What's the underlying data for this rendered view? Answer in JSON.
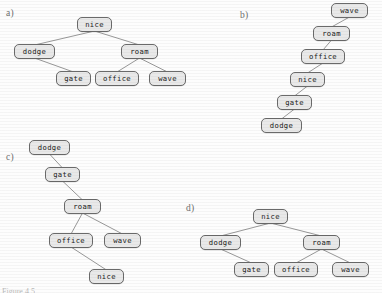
{
  "figure": {
    "caption": "Figure 4.5",
    "node_fill": "#e9e9e9",
    "node_border": "#6a6a6a",
    "edge_color": "#8c8c8c",
    "text_color": "#1a1a1a",
    "background": "#fdfdfd"
  },
  "panels": [
    {
      "id": "a",
      "label": "a)",
      "label_pos": {
        "x": 6,
        "y": 8
      },
      "root": "nice",
      "nodes": [
        {
          "key": "nice",
          "text": "nice",
          "x": 77,
          "y": 17,
          "w": 35
        },
        {
          "key": "dodge",
          "text": "dodge",
          "x": 14,
          "y": 44,
          "w": 41
        },
        {
          "key": "roam",
          "text": "roam",
          "x": 121,
          "y": 44,
          "w": 37
        },
        {
          "key": "gate",
          "text": "gate",
          "x": 56,
          "y": 71,
          "w": 35
        },
        {
          "key": "office",
          "text": "office",
          "x": 95,
          "y": 71,
          "w": 44
        },
        {
          "key": "wave",
          "text": "wave",
          "x": 149,
          "y": 71,
          "w": 37
        }
      ],
      "edges": [
        {
          "from": "nice",
          "to": "dodge",
          "side": "left"
        },
        {
          "from": "nice",
          "to": "roam",
          "side": "right"
        },
        {
          "from": "dodge",
          "to": "gate",
          "side": "right"
        },
        {
          "from": "roam",
          "to": "office",
          "side": "left"
        },
        {
          "from": "roam",
          "to": "wave",
          "side": "right"
        }
      ]
    },
    {
      "id": "b",
      "label": "b)",
      "label_pos": {
        "x": 240,
        "y": 10
      },
      "root": "wave",
      "nodes": [
        {
          "key": "wave",
          "text": "wave",
          "x": 331,
          "y": 3,
          "w": 37
        },
        {
          "key": "roam",
          "text": "roam",
          "x": 313,
          "y": 26,
          "w": 37
        },
        {
          "key": "office",
          "text": "office",
          "x": 301,
          "y": 49,
          "w": 44
        },
        {
          "key": "nice",
          "text": "nice",
          "x": 290,
          "y": 72,
          "w": 35
        },
        {
          "key": "gate",
          "text": "gate",
          "x": 277,
          "y": 95,
          "w": 35
        },
        {
          "key": "dodge",
          "text": "dodge",
          "x": 261,
          "y": 118,
          "w": 41
        }
      ],
      "edges": [
        {
          "from": "wave",
          "to": "roam",
          "side": "left"
        },
        {
          "from": "roam",
          "to": "office",
          "side": "left"
        },
        {
          "from": "office",
          "to": "nice",
          "side": "left"
        },
        {
          "from": "nice",
          "to": "gate",
          "side": "left"
        },
        {
          "from": "gate",
          "to": "dodge",
          "side": "left"
        }
      ]
    },
    {
      "id": "c",
      "label": "c)",
      "label_pos": {
        "x": 6,
        "y": 152
      },
      "root": "dodge",
      "nodes": [
        {
          "key": "dodge",
          "text": "dodge",
          "x": 29,
          "y": 140,
          "w": 41
        },
        {
          "key": "gate",
          "text": "gate",
          "x": 45,
          "y": 167,
          "w": 35
        },
        {
          "key": "roam",
          "text": "roam",
          "x": 64,
          "y": 199,
          "w": 37
        },
        {
          "key": "office",
          "text": "office",
          "x": 49,
          "y": 233,
          "w": 44
        },
        {
          "key": "wave",
          "text": "wave",
          "x": 104,
          "y": 233,
          "w": 37
        },
        {
          "key": "nice",
          "text": "nice",
          "x": 89,
          "y": 269,
          "w": 35
        }
      ],
      "edges": [
        {
          "from": "dodge",
          "to": "gate",
          "side": "right"
        },
        {
          "from": "gate",
          "to": "roam",
          "side": "right"
        },
        {
          "from": "roam",
          "to": "office",
          "side": "left"
        },
        {
          "from": "roam",
          "to": "wave",
          "side": "right"
        },
        {
          "from": "office",
          "to": "nice",
          "side": "right"
        }
      ]
    },
    {
      "id": "d",
      "label": "d)",
      "label_pos": {
        "x": 186,
        "y": 203
      },
      "root": "nice",
      "nodes": [
        {
          "key": "nice",
          "text": "nice",
          "x": 253,
          "y": 209,
          "w": 35
        },
        {
          "key": "dodge",
          "text": "dodge",
          "x": 200,
          "y": 235,
          "w": 41
        },
        {
          "key": "roam",
          "text": "roam",
          "x": 303,
          "y": 235,
          "w": 37
        },
        {
          "key": "gate",
          "text": "gate",
          "x": 234,
          "y": 262,
          "w": 35
        },
        {
          "key": "office",
          "text": "office",
          "x": 274,
          "y": 262,
          "w": 44
        },
        {
          "key": "wave",
          "text": "wave",
          "x": 332,
          "y": 262,
          "w": 37
        }
      ],
      "edges": [
        {
          "from": "nice",
          "to": "dodge",
          "side": "left"
        },
        {
          "from": "nice",
          "to": "roam",
          "side": "right"
        },
        {
          "from": "dodge",
          "to": "gate",
          "side": "right"
        },
        {
          "from": "roam",
          "to": "office",
          "side": "left"
        },
        {
          "from": "roam",
          "to": "wave",
          "side": "right"
        }
      ]
    }
  ]
}
